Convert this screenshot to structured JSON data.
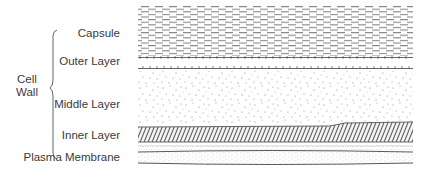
{
  "diagram": {
    "group_label": {
      "line1": "Cell",
      "line2": "Wall"
    },
    "labels": {
      "capsule": "Capsule",
      "outer_layer": "Outer Layer",
      "middle_layer": "Middle Layer",
      "inner_layer": "Inner Layer",
      "plasma_membrane": "Plasma Membrane"
    },
    "layers": [
      {
        "name": "Capsule",
        "pattern": "dashes",
        "y_top": 5,
        "y_bottom": 56
      },
      {
        "name": "Outer Layer",
        "pattern": "tick-lines",
        "y_top": 57,
        "y_bottom": 69
      },
      {
        "name": "Middle Layer",
        "pattern": "stipple",
        "y_top": 70,
        "y_bottom": 123
      },
      {
        "name": "Inner Layer",
        "pattern": "diagonal-hatch",
        "y_top": 125,
        "y_bottom": 142
      },
      {
        "name": "Plasma Membrane",
        "pattern": "fine-stipple-between-lines",
        "y_top": 143,
        "y_bottom": 164
      }
    ],
    "colors": {
      "ink": "#555555",
      "text": "#3a3a3a",
      "background": "#ffffff"
    }
  }
}
